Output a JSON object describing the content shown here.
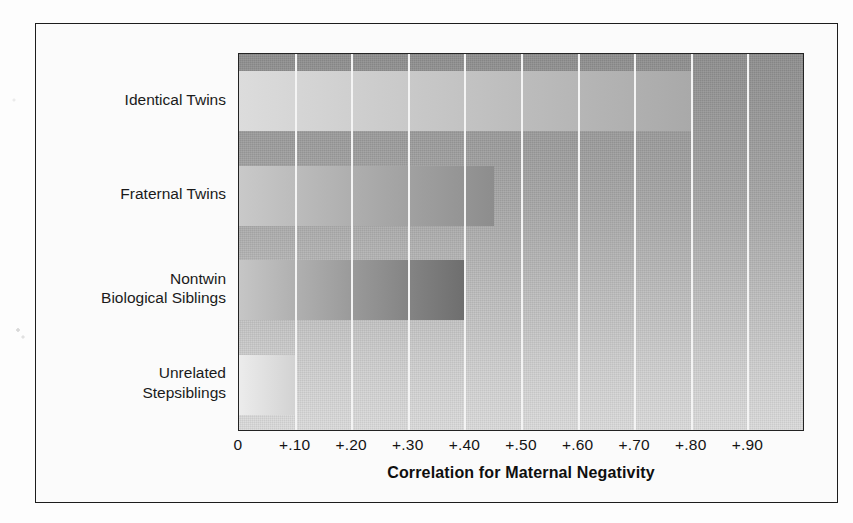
{
  "figure": {
    "axis_title": "Correlation for Maternal Negativity"
  },
  "chart_data": {
    "type": "bar",
    "orientation": "horizontal",
    "title": "",
    "xlabel": "Correlation for Maternal Negativity",
    "ylabel": "",
    "categories": [
      "Identical Twins",
      "Fraternal Twins",
      "Nontwin\nBiological Siblings",
      "Unrelated\nStepsiblings"
    ],
    "values": [
      0.8,
      0.45,
      0.4,
      0.1
    ],
    "xlim": [
      0,
      1.0
    ],
    "xticks": [
      0,
      0.1,
      0.2,
      0.3,
      0.4,
      0.5,
      0.6,
      0.7,
      0.8,
      0.9
    ],
    "xticklabels": [
      "0",
      "+.10",
      "+.20",
      "+.30",
      "+.40",
      "+.50",
      "+.60",
      "+.70",
      "+.80",
      "+.90"
    ],
    "grid": "vertical-white-gridlines",
    "legend": "none",
    "bar_shading": [
      {
        "category": "Identical Twins",
        "from": "#dcdcdc",
        "to": "#a9a9a9"
      },
      {
        "category": "Fraternal Twins",
        "from": "#c9c9c9",
        "to": "#8d8d8d"
      },
      {
        "category": "Nontwin Biological Siblings",
        "from": "#c6c6c6",
        "to": "#6e6e6e"
      },
      {
        "category": "Unrelated Stepsiblings",
        "from": "#ececec",
        "to": "#d2d2d2"
      }
    ],
    "plot_background": "vertical gray gradient, dark top to light bottom"
  },
  "colors": {
    "frame": "#1d1d1d",
    "gridline": "#f4f4f4",
    "text": "#141414",
    "page": "#fdfdfd"
  }
}
